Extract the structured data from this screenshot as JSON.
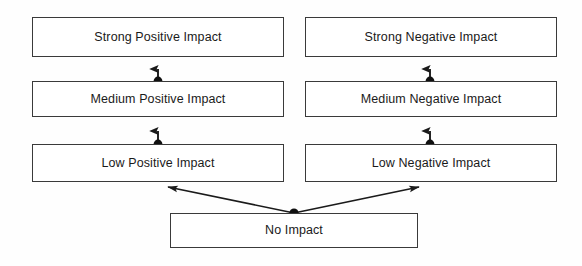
{
  "diagram": {
    "background_color": "#ffffff",
    "line_color": "#1a1a1a",
    "box_border_color": "#3a3a3a",
    "text_color": "#1a1a1a",
    "nodes": [
      {
        "id": "strong-positive",
        "label": "Strong Positive Impact",
        "column": "positive",
        "level": "strong"
      },
      {
        "id": "medium-positive",
        "label": "Medium Positive Impact",
        "column": "positive",
        "level": "medium"
      },
      {
        "id": "low-positive",
        "label": "Low Positive Impact",
        "column": "positive",
        "level": "low"
      },
      {
        "id": "strong-negative",
        "label": "Strong Negative Impact",
        "column": "negative",
        "level": "strong"
      },
      {
        "id": "medium-negative",
        "label": "Medium Negative Impact",
        "column": "negative",
        "level": "medium"
      },
      {
        "id": "low-negative",
        "label": "Low Negative Impact",
        "column": "negative",
        "level": "low"
      },
      {
        "id": "no-impact",
        "label": "No Impact",
        "column": "center",
        "level": "none"
      }
    ],
    "edges": [
      {
        "from": "no-impact",
        "to": "low-positive",
        "style": "diagonal-arrow",
        "source_marker": "filled-dot"
      },
      {
        "from": "no-impact",
        "to": "low-negative",
        "style": "diagonal-arrow",
        "source_marker": "filled-dot"
      },
      {
        "from": "low-positive",
        "to": "medium-positive",
        "style": "vertical-arrow",
        "source_marker": "filled-dot"
      },
      {
        "from": "medium-positive",
        "to": "strong-positive",
        "style": "vertical-arrow",
        "source_marker": "filled-dot"
      },
      {
        "from": "low-negative",
        "to": "medium-negative",
        "style": "vertical-arrow",
        "source_marker": "filled-dot"
      },
      {
        "from": "medium-negative",
        "to": "strong-negative",
        "style": "vertical-arrow",
        "source_marker": "filled-dot"
      }
    ]
  }
}
